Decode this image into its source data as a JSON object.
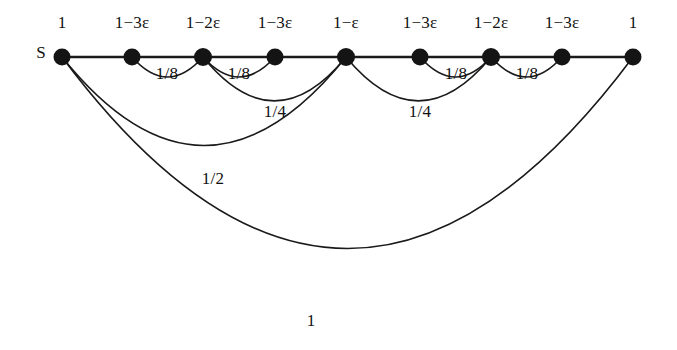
{
  "figure": {
    "type": "graph-diagram",
    "background_color": "#ffffff",
    "stroke_color": "#1a1a1a",
    "node_fill_color": "#141414",
    "width": 677,
    "height": 350
  },
  "source_marker": {
    "label": "S",
    "x": 41,
    "y": 52
  },
  "nodes": [
    {
      "id": "n1",
      "label": "1",
      "x": 62,
      "y": 57,
      "r": 8.5,
      "label_x": 62,
      "label_y": 22
    },
    {
      "id": "n2",
      "label": "1−3ε",
      "x": 132,
      "y": 57,
      "r": 8.5,
      "label_x": 132,
      "label_y": 22
    },
    {
      "id": "n3",
      "label": "1−2ε",
      "x": 203,
      "y": 57,
      "r": 9.0,
      "label_x": 203,
      "label_y": 22
    },
    {
      "id": "n4",
      "label": "1−3ε",
      "x": 275,
      "y": 57,
      "r": 8.5,
      "label_x": 275,
      "label_y": 22
    },
    {
      "id": "n5",
      "label": "1−ε",
      "x": 346,
      "y": 57,
      "r": 9.0,
      "label_x": 346,
      "label_y": 22
    },
    {
      "id": "n6",
      "label": "1−3ε",
      "x": 420,
      "y": 57,
      "r": 8.5,
      "label_x": 420,
      "label_y": 22
    },
    {
      "id": "n7",
      "label": "1−2ε",
      "x": 491,
      "y": 57,
      "r": 9.0,
      "label_x": 491,
      "label_y": 22
    },
    {
      "id": "n8",
      "label": "1−3ε",
      "x": 562,
      "y": 57,
      "r": 8.5,
      "label_x": 562,
      "label_y": 22
    },
    {
      "id": "n9",
      "label": "1",
      "x": 633,
      "y": 57,
      "r": 8.5,
      "label_x": 633,
      "label_y": 22
    }
  ],
  "spine_edges": [
    {
      "from": "n1",
      "to": "n2"
    },
    {
      "from": "n2",
      "to": "n3"
    },
    {
      "from": "n3",
      "to": "n4"
    },
    {
      "from": "n4",
      "to": "n5"
    },
    {
      "from": "n5",
      "to": "n6"
    },
    {
      "from": "n6",
      "to": "n7"
    },
    {
      "from": "n7",
      "to": "n8"
    },
    {
      "from": "n8",
      "to": "n9"
    }
  ],
  "arc_edges": [
    {
      "id": "arc-1-8-a",
      "label": "1/8",
      "from": "n2",
      "to": "n3",
      "from_x": 132,
      "to_x": 203,
      "depth": 30,
      "label_x": 167,
      "label_y": 73
    },
    {
      "id": "arc-1-8-b",
      "label": "1/8",
      "from": "n3",
      "to": "n4",
      "from_x": 203,
      "to_x": 275,
      "depth": 30,
      "label_x": 239,
      "label_y": 73
    },
    {
      "id": "arc-1-8-c",
      "label": "1/8",
      "from": "n6",
      "to": "n7",
      "from_x": 420,
      "to_x": 491,
      "depth": 30,
      "label_x": 456,
      "label_y": 73
    },
    {
      "id": "arc-1-8-d",
      "label": "1/8",
      "from": "n7",
      "to": "n8",
      "from_x": 491,
      "to_x": 562,
      "depth": 30,
      "label_x": 527,
      "label_y": 73
    },
    {
      "id": "arc-1-4-a",
      "label": "1/4",
      "from": "n3",
      "to": "n5",
      "from_x": 203,
      "to_x": 346,
      "depth": 66,
      "label_x": 275,
      "label_y": 111
    },
    {
      "id": "arc-1-4-b",
      "label": "1/4",
      "from": "n5",
      "to": "n7",
      "from_x": 346,
      "to_x": 491,
      "depth": 66,
      "label_x": 420,
      "label_y": 111
    },
    {
      "id": "arc-1-2",
      "label": "1/2",
      "from": "n1",
      "to": "n5",
      "from_x": 62,
      "to_x": 346,
      "depth": 133,
      "label_x": 213,
      "label_y": 178
    },
    {
      "id": "arc-1",
      "label": "1",
      "from": "n1",
      "to": "n9",
      "from_x": 62,
      "to_x": 633,
      "depth": 288,
      "label_x": 311,
      "label_y": 320
    }
  ],
  "edge_label_list": [
    "1/8",
    "1/8",
    "1/4",
    "1/4",
    "1/8",
    "1/8",
    "1/2",
    "1"
  ]
}
